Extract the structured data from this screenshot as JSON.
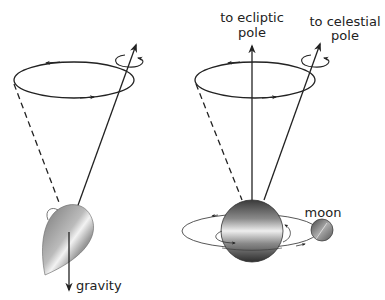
{
  "diagram": {
    "left_panel": {
      "name": "spinning-top",
      "labels": {
        "force": "gravity"
      }
    },
    "right_panel": {
      "name": "earth-precession",
      "labels": {
        "ecliptic_line1": "to ecliptic",
        "ecliptic_line2": "pole",
        "celestial_line1": "to celestial",
        "celestial_line2": "pole",
        "moon": "moon"
      }
    },
    "colors": {
      "ink": "#222222",
      "background": "#ffffff"
    }
  }
}
